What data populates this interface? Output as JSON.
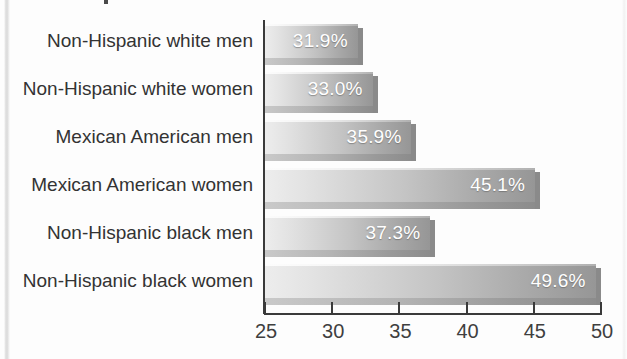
{
  "chart_data": {
    "type": "bar",
    "orientation": "horizontal",
    "title": "",
    "xlabel": "",
    "ylabel": "",
    "xlim": [
      25,
      50
    ],
    "grid": false,
    "legend": null,
    "value_suffix": "%",
    "categories": [
      "Non-Hispanic white men",
      "Non-Hispanic white women",
      "Mexican American men",
      "Mexican American women",
      "Non-Hispanic black men",
      "Non-Hispanic black women"
    ],
    "values": [
      31.9,
      33.0,
      35.9,
      45.1,
      37.3,
      49.6
    ],
    "value_labels": [
      "31.9%",
      "33.0%",
      "35.9%",
      "45.1%",
      "37.3%",
      "49.6%"
    ],
    "x_ticks": [
      25,
      30,
      35,
      40,
      45,
      50
    ],
    "x_tick_labels": [
      "25",
      "30",
      "35",
      "40",
      "45",
      "50"
    ],
    "colors": {
      "bar_light": "#ededed",
      "bar_dark": "#969696",
      "bar_shadow": "#8c8c8c",
      "axis": "#3a3a3a",
      "label_text": "#333333",
      "value_text": "#ffffff",
      "background": "#fdfdfd"
    }
  }
}
